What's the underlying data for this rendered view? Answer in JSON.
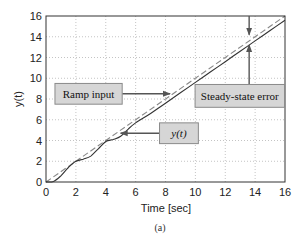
{
  "chart_data": {
    "type": "line",
    "title": "",
    "xlabel": "Time [sec]",
    "ylabel": "y(t)",
    "xlim": [
      0,
      16
    ],
    "ylim": [
      0,
      16
    ],
    "xticks": [
      0,
      2,
      4,
      6,
      8,
      10,
      12,
      14,
      16
    ],
    "yticks": [
      0,
      2,
      4,
      6,
      8,
      10,
      12,
      14,
      16
    ],
    "grid": true,
    "grid_style": "dotted",
    "caption": "(a)",
    "series": [
      {
        "name": "Ramp input",
        "style": "dashed",
        "color": "#888888",
        "x": [
          0,
          16
        ],
        "y": [
          0,
          16
        ]
      },
      {
        "name": "y(t)",
        "style": "solid",
        "color": "#333333",
        "x": [
          0,
          0.5,
          1,
          1.5,
          2,
          2.5,
          3,
          3.5,
          4,
          4.5,
          5,
          5.5,
          6,
          7,
          8,
          9,
          10,
          11,
          12,
          13,
          14,
          15,
          16
        ],
        "y": [
          0,
          0.05,
          0.6,
          1.4,
          2.0,
          2.2,
          2.5,
          3.2,
          3.9,
          4.1,
          4.4,
          5.1,
          5.7,
          6.6,
          7.6,
          8.6,
          9.6,
          10.6,
          11.6,
          12.6,
          13.6,
          14.6,
          15.6
        ]
      }
    ],
    "annotations": [
      {
        "text": "Ramp input",
        "box": [
          0.6,
          7.5,
          5.1,
          9.5
        ],
        "arrow_to": [
          8.3,
          8.5
        ]
      },
      {
        "text": "y(t)",
        "box": [
          7.6,
          3.7,
          10.2,
          5.7
        ],
        "arrow_to": [
          5.0,
          4.7
        ]
      },
      {
        "text": "Steady-state error",
        "box": [
          9.98,
          7.2,
          15.97,
          9.4
        ],
        "arrow_to": [
          13.6,
          13.6
        ],
        "arrow_from_top_to": [
          13.6,
          13.6
        ]
      }
    ]
  },
  "labels": {
    "ramp": "Ramp input",
    "yt": "y(t)",
    "sse": "Steady-state error",
    "xlabel": "Time [sec]",
    "ylabel": "y(t)",
    "caption": "(a)"
  },
  "colors": {
    "box_fill": "#d6d6d6",
    "box_stroke": "#8a8a8a",
    "arrow": "#555555",
    "grid": "#b5b5b5",
    "axes": "#333333"
  }
}
